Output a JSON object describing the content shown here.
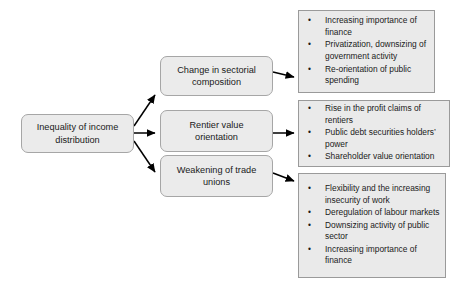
{
  "diagram": {
    "type": "flow-diagram",
    "source": {
      "id": "inequality",
      "label": "Inequality of income\ndistribution"
    },
    "channels": [
      {
        "id": "sectorial",
        "label": "Change in sectorial\ncomposition",
        "outcomes": [
          "Increasing importance of finance",
          "Privatization, downsizing of government activity",
          "Re-orientation of public spending"
        ]
      },
      {
        "id": "rentier",
        "label": "Rentier value\norientation",
        "outcomes": [
          "Rise in the profit claims of rentiers",
          "Public debt securities holders’ power",
          "Shareholder value orientation"
        ]
      },
      {
        "id": "unions",
        "label": "Weakening of trade\nunions",
        "outcomes": [
          "Flexibility and the increasing insecurity of work",
          "Deregulation of labour markets",
          "Downsizing activity of public sector",
          "Increasing importance of finance"
        ]
      }
    ],
    "bullet_glyph": "•",
    "colors": {
      "node_fill": "#ebebeb",
      "node_border": "#a6a6a6",
      "list_fill": "#eaeaea",
      "list_border": "#9a9a9a",
      "arrow": "#000000",
      "text": "#1a1a1a",
      "background": "#ffffff"
    }
  }
}
